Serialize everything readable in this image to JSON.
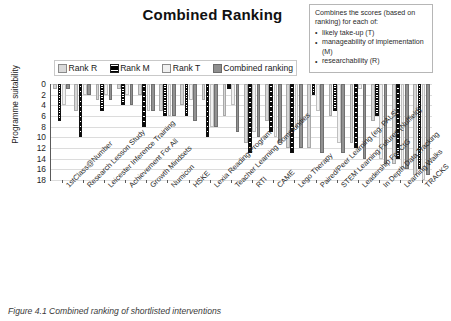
{
  "figure": {
    "title": "Combined Ranking",
    "caption": "Figure 4.1 Combined ranking of shortlisted interventions"
  },
  "callout": {
    "lead": "Combines the scores (based on ranking) for each of:",
    "bullet_glyph": "•",
    "items": [
      "likely take-up (T)",
      "manageability of implementation (M)",
      "researchability (R)"
    ]
  },
  "legend": {
    "entries": [
      {
        "label": "Rank R",
        "swatch": "light-grey-swatch",
        "color": "#d9d9d9"
      },
      {
        "label": "Rank M",
        "swatch": "black-hatched-swatch",
        "color": "#0a0a0a"
      },
      {
        "label": "Rank T",
        "swatch": "very-light-grey-swatch",
        "color": "#f0f0f0"
      },
      {
        "label": "Combined ranking",
        "swatch": "mid-grey-swatch",
        "color": "#8f8f8f"
      }
    ]
  },
  "chart_data": {
    "type": "bar",
    "title": "Combined Ranking",
    "xlabel": "",
    "ylabel": "Programme suitability",
    "ylim": [
      0,
      18
    ],
    "y_inverted": true,
    "ytick_step": 2,
    "yticks": [
      0,
      2,
      4,
      6,
      8,
      10,
      12,
      14,
      16,
      18
    ],
    "grid": true,
    "legend_position": "above-plot",
    "categories": [
      "1stClass@Number",
      "Research Lesson Study",
      "Leicester Inference Training",
      "Achievement For All",
      "Growth Mindsets",
      "Numicon",
      "HSKE",
      "Lexia Reading Program",
      "Teacher Learning Communities",
      "RTI",
      "CAME",
      "Lego Therapy",
      "Paired/Peer Learning (eg. PALS)",
      "STEM Learning Futures (Nuffield)",
      "Leadership For CtG",
      "In Depth Data Tracking",
      "Learning Walks",
      "TRACKS"
    ],
    "series": [
      {
        "name": "Rank R",
        "color": "#d6d6d6",
        "values": [
          1,
          5,
          3,
          1,
          2,
          5,
          4,
          3,
          6,
          11,
          7,
          12,
          12,
          6,
          11,
          7,
          15,
          17
        ]
      },
      {
        "name": "Rank M",
        "color": "#0a0a0a",
        "values": [
          7,
          10,
          5,
          4,
          8,
          6,
          6,
          10,
          1,
          13,
          9,
          13,
          2,
          5,
          12,
          6,
          14,
          16
        ]
      },
      {
        "name": "Rank T",
        "color": "#f2f2f2",
        "values": [
          4,
          2,
          2,
          2,
          5,
          6,
          3,
          8,
          4,
          9,
          10,
          8,
          5,
          11,
          1,
          14,
          16,
          18
        ]
      },
      {
        "name": "Combined ranking",
        "color": "#929292",
        "values": [
          1,
          2,
          3,
          4,
          5,
          6,
          7,
          8,
          9,
          10,
          11,
          12,
          13,
          13,
          14,
          15,
          16,
          17
        ]
      }
    ]
  }
}
